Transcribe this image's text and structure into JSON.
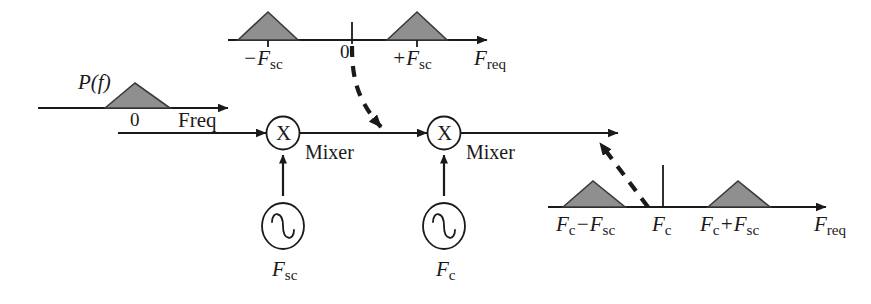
{
  "diagram": {
    "colors": {
      "stroke": "#1a1a1a",
      "triangle_fill": "#8f8f8f",
      "background": "#ffffff"
    },
    "input_spectrum": {
      "name": "baseband-spectrum",
      "amplitude_label": "P(f)",
      "amplitude_label_parts": {
        "p": "P(",
        "f": "f",
        "close": ")"
      },
      "origin_tick_label": "0",
      "axis_label": "Freq",
      "triangles": [
        {
          "center": 0,
          "label": "0"
        }
      ]
    },
    "subcarrier_spectrum": {
      "name": "subcarrier-spectrum",
      "origin_tick_label": "0",
      "axis_label": "F_req",
      "axis_label_parts": {
        "base": "F",
        "sub": "req"
      },
      "ticks": [
        {
          "label_base": "−F",
          "label_sub": "sc",
          "text": "−F_sc"
        },
        {
          "label_base": "+F",
          "label_sub": "sc",
          "text": "+F_sc"
        }
      ]
    },
    "output_spectrum": {
      "name": "rf-output-spectrum",
      "axis_label": "F_req",
      "axis_label_parts": {
        "base": "F",
        "sub": "req"
      },
      "carrier": {
        "label_base": "F",
        "label_sub": "c",
        "text": "F_c"
      },
      "ticks": [
        {
          "label_base": "F",
          "label_sub": "c",
          "label_base2": "−F",
          "label_sub2": "sc",
          "text": "F_c−F_sc"
        },
        {
          "label_base": "F",
          "label_sub": "c",
          "label_base2": "+F",
          "label_sub2": "sc",
          "text": "F_c+F_sc"
        }
      ]
    },
    "mixers": [
      {
        "name": "mixer-1",
        "symbol": "X",
        "label": "Mixer"
      },
      {
        "name": "mixer-2",
        "symbol": "X",
        "label": "Mixer"
      }
    ],
    "oscillators": [
      {
        "name": "oscillator-subcarrier",
        "label_base": "F",
        "label_sub": "sc",
        "text": "F_sc"
      },
      {
        "name": "oscillator-carrier",
        "label_base": "F",
        "label_sub": "c",
        "text": "F_c"
      }
    ]
  }
}
